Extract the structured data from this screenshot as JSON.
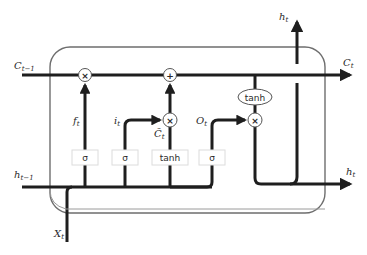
{
  "diagram": {
    "type": "LSTM cell",
    "colors": {
      "line": "#1e1e1e",
      "cell_border": "#6e6e6e",
      "gate_box_border": "#dcdcdc",
      "background": "#ffffff"
    },
    "inputs": {
      "cell_state_prev": {
        "main": "C",
        "sub": "t−1"
      },
      "hidden_prev": {
        "main": "h",
        "sub": "t−1"
      },
      "x": {
        "main": "X",
        "sub": "t"
      }
    },
    "outputs": {
      "cell_state": {
        "main": "C",
        "sub": "t"
      },
      "hidden_up": {
        "main": "h",
        "sub": "t"
      },
      "hidden_right": {
        "main": "h",
        "sub": "t"
      }
    },
    "gate_labels": {
      "forget": {
        "main": "f",
        "sub": "t"
      },
      "input": {
        "main": "i",
        "sub": "t"
      },
      "candidate": {
        "main": "C̃",
        "sub": "t"
      },
      "output": {
        "main": "O",
        "sub": "t"
      }
    },
    "operators": {
      "forget_mult": "×",
      "add": "+",
      "input_mult": "×",
      "output_mult": "×"
    },
    "gate_boxes": [
      "σ",
      "σ",
      "tanh",
      "σ"
    ],
    "cell_tanh": "tanh"
  }
}
